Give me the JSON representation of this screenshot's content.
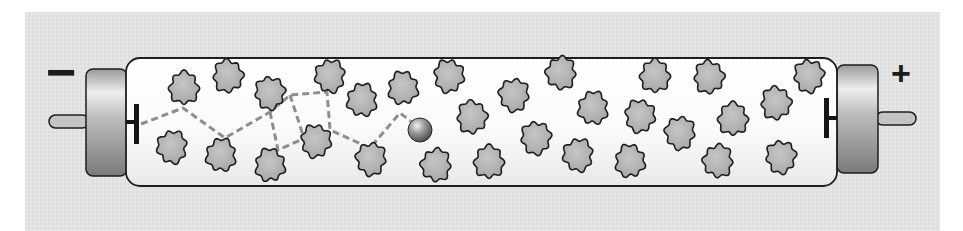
{
  "diagram": {
    "type": "gas-discharge-tube",
    "colors": {
      "page_background": "#ffffff",
      "panel_background": "#e2e2e2",
      "tube_glass": "#fafafa",
      "tube_outline": "#1e1e1e",
      "end_cap_light": "#e6e6e6",
      "end_cap_dark": "#8a8a8a",
      "pin_fill": "#c4c4c4",
      "atom_fill": "#b4b4b4",
      "atom_outline": "#1e1e1e",
      "electron_fill": "#8c8c8c",
      "path_dash": "#8e8e8e",
      "electrode": "#151515"
    },
    "panel": {
      "x": 25,
      "y": 12,
      "width": 915,
      "height": 219
    },
    "tube": {
      "x": 126,
      "y": 58,
      "width": 711,
      "height": 128,
      "radius": 14
    },
    "left_terminal": {
      "polarity": "negative",
      "label": "−",
      "label_x": 46,
      "label_y": 72,
      "cap": {
        "x": 86,
        "y": 69,
        "width": 41,
        "height": 107,
        "radius": 7
      },
      "pin": {
        "x": 49,
        "y": 115,
        "width": 40,
        "height": 13
      },
      "electrode": {
        "x": 134,
        "y": 104,
        "width": 5,
        "height": 40,
        "stem_to_x": 145,
        "stem_y": 122
      }
    },
    "right_terminal": {
      "polarity": "positive",
      "label": "+",
      "label_x": 891,
      "label_y": 76,
      "cap": {
        "x": 837,
        "y": 65,
        "width": 41,
        "height": 108,
        "radius": 7
      },
      "pin": {
        "x": 876,
        "y": 112,
        "width": 40,
        "height": 13
      },
      "electrode": {
        "x": 824,
        "y": 98,
        "width": 5,
        "height": 40,
        "stem_from_x": 826,
        "stem_y": 118
      }
    },
    "electron": {
      "cx": 420,
      "cy": 130,
      "r": 12
    },
    "collision_path": {
      "main": [
        [
          141,
          124
        ],
        [
          183,
          108
        ],
        [
          225,
          138
        ],
        [
          270,
          112
        ],
        [
          290,
          95
        ],
        [
          327,
          92
        ],
        [
          330,
          130
        ],
        [
          370,
          148
        ],
        [
          400,
          113
        ],
        [
          413,
          123
        ]
      ],
      "branches": [
        [
          [
            270,
            112
          ],
          [
            278,
            150
          ],
          [
            314,
            134
          ]
        ],
        [
          [
            290,
            95
          ],
          [
            303,
            135
          ]
        ]
      ]
    },
    "atoms": [
      {
        "cx": 184,
        "cy": 88
      },
      {
        "cx": 228,
        "cy": 76
      },
      {
        "cx": 270,
        "cy": 93
      },
      {
        "cx": 330,
        "cy": 76
      },
      {
        "cx": 362,
        "cy": 100
      },
      {
        "cx": 403,
        "cy": 88
      },
      {
        "cx": 449,
        "cy": 76
      },
      {
        "cx": 514,
        "cy": 95
      },
      {
        "cx": 561,
        "cy": 73
      },
      {
        "cx": 655,
        "cy": 76
      },
      {
        "cx": 709,
        "cy": 77
      },
      {
        "cx": 809,
        "cy": 76
      },
      {
        "cx": 172,
        "cy": 147
      },
      {
        "cx": 221,
        "cy": 155
      },
      {
        "cx": 270,
        "cy": 165
      },
      {
        "cx": 316,
        "cy": 141
      },
      {
        "cx": 371,
        "cy": 159
      },
      {
        "cx": 436,
        "cy": 165
      },
      {
        "cx": 489,
        "cy": 162
      },
      {
        "cx": 472,
        "cy": 117
      },
      {
        "cx": 536,
        "cy": 138
      },
      {
        "cx": 578,
        "cy": 155
      },
      {
        "cx": 593,
        "cy": 108
      },
      {
        "cx": 630,
        "cy": 161
      },
      {
        "cx": 640,
        "cy": 116
      },
      {
        "cx": 680,
        "cy": 133
      },
      {
        "cx": 718,
        "cy": 161
      },
      {
        "cx": 733,
        "cy": 119
      },
      {
        "cx": 776,
        "cy": 103
      },
      {
        "cx": 781,
        "cy": 157
      }
    ],
    "atom_radius": 16
  }
}
